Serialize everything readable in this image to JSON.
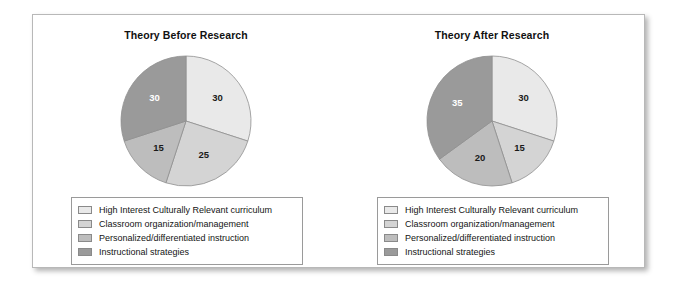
{
  "figure": {
    "background_color": "#ffffff",
    "frame_border_color": "#b8b8b8"
  },
  "palette": {
    "high_interest": "#e9e9e9",
    "classroom_org": "#d4d4d4",
    "personalized": "#bdbdbd",
    "instructional": "#9a9a9a",
    "slice_edge": "#8f8f8f",
    "label_dark": "#1a1a1a",
    "label_light": "#ffffff"
  },
  "legend": {
    "items": [
      {
        "label": "High Interest Culturally Relevant curriculum",
        "color": "#e9e9e9"
      },
      {
        "label": "Classroom organization/management",
        "color": "#d4d4d4"
      },
      {
        "label": "Personalized/differentiated instruction",
        "color": "#bdbdbd"
      },
      {
        "label": "Instructional strategies",
        "color": "#9a9a9a"
      }
    ]
  },
  "chart_data": [
    {
      "type": "pie",
      "title": "Theory Before Research",
      "categories": [
        "High Interest Culturally Relevant curriculum",
        "Classroom organization/management",
        "Personalized/differentiated instruction",
        "Instructional strategies"
      ],
      "values": [
        30,
        25,
        15,
        30
      ],
      "data_labels": [
        "30",
        "25",
        "15",
        "30"
      ],
      "colors": [
        "#e9e9e9",
        "#d4d4d4",
        "#bdbdbd",
        "#9a9a9a"
      ],
      "label_colors": [
        "#1a1a1a",
        "#1a1a1a",
        "#1a1a1a",
        "#ffffff"
      ],
      "total": 100,
      "start_angle_deg": 0,
      "direction": "clockwise",
      "legend_position": "bottom"
    },
    {
      "type": "pie",
      "title": "Theory After Research",
      "categories": [
        "High Interest Culturally Relevant curriculum",
        "Classroom organization/management",
        "Personalized/differentiated instruction",
        "Instructional strategies"
      ],
      "values": [
        30,
        15,
        20,
        35
      ],
      "data_labels": [
        "30",
        "15",
        "20",
        "35"
      ],
      "colors": [
        "#e9e9e9",
        "#d4d4d4",
        "#bdbdbd",
        "#9a9a9a"
      ],
      "label_colors": [
        "#1a1a1a",
        "#1a1a1a",
        "#1a1a1a",
        "#ffffff"
      ],
      "total": 100,
      "start_angle_deg": 0,
      "direction": "clockwise",
      "legend_position": "bottom"
    }
  ]
}
